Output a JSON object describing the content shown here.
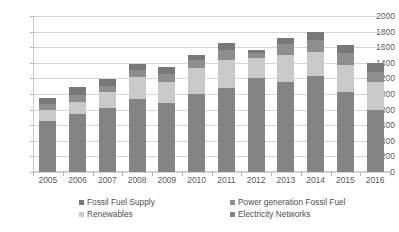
{
  "chart_data": {
    "type": "bar",
    "subtype": "stacked-bar",
    "title": "",
    "xlabel": "",
    "ylabel": "",
    "ylim": [
      0,
      2000
    ],
    "ytick_step": 200,
    "yticks": [
      0,
      200,
      400,
      600,
      800,
      1000,
      1200,
      1400,
      1600,
      1800,
      2000
    ],
    "ytick_labels": [
      "0",
      "200",
      "400",
      "600",
      "800",
      "1000",
      "1200",
      "1400",
      "1600",
      "1800",
      "2000"
    ],
    "grid": true,
    "grid_axis": "y",
    "legend_position": "bottom",
    "categories": [
      "2005",
      "2006",
      "2007",
      "2008",
      "2009",
      "2010",
      "2011",
      "2012",
      "2013",
      "2014",
      "2015",
      "2016"
    ],
    "series": [
      {
        "name": "Electricity Networks",
        "color": "#848484",
        "values": [
          660,
          750,
          820,
          930,
          890,
          1000,
          1080,
          1210,
          1150,
          1230,
          1030,
          800
        ]
      },
      {
        "name": "Renewables",
        "color": "#c9c9c9",
        "values": [
          130,
          150,
          200,
          290,
          270,
          330,
          360,
          250,
          350,
          310,
          340,
          350
        ]
      },
      {
        "name": "Power generation Fossil Fuel",
        "color": "#8e8e8e",
        "values": [
          80,
          90,
          85,
          90,
          100,
          100,
          120,
          60,
          140,
          150,
          150,
          130
        ]
      },
      {
        "name": "Fossil Fuel Supply",
        "color": "#787878",
        "values": [
          80,
          100,
          90,
          75,
          90,
          70,
          90,
          40,
          80,
          100,
          110,
          120
        ]
      }
    ],
    "totals": [
      950,
      1090,
      1195,
      1385,
      1350,
      1500,
      1650,
      1560,
      1720,
      1790,
      1630,
      1400
    ]
  },
  "legend": {
    "items": [
      {
        "label": "Fossil Fuel Supply",
        "swatch": "#787878"
      },
      {
        "label": "Power generation Fossil Fuel",
        "swatch": "#8e8e8e"
      },
      {
        "label": "Renewables",
        "swatch": "#c9c9c9"
      },
      {
        "label": "Electricity Networks",
        "swatch": "#848484"
      }
    ]
  }
}
